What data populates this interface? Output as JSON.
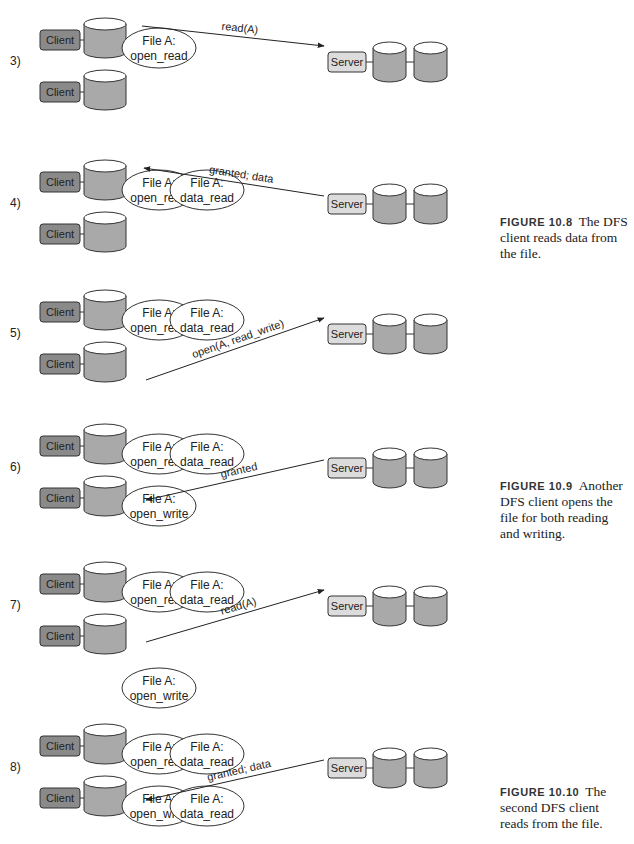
{
  "colors": {
    "client_fill": "#8a8a8a",
    "server_fill": "#dcdcdc",
    "cylinder_body": "#a9a9a9",
    "cylinder_top": "#ffffff",
    "stroke": "#333333"
  },
  "panels": [
    {
      "step": "3)",
      "y": 16,
      "client_label": "Client",
      "server_label": "Server",
      "bubbles_top": [
        {
          "line1": "File A:",
          "line2": "open_read"
        }
      ],
      "bubbles_bottom": [],
      "message": {
        "text": "read(A)",
        "direction": "to-server",
        "from": "client1"
      }
    },
    {
      "step": "4)",
      "y": 158,
      "client_label": "Client",
      "server_label": "Server",
      "bubbles_top": [
        {
          "line1": "File A:",
          "line2": "open_read"
        },
        {
          "line1": "File A:",
          "line2": "data_read"
        }
      ],
      "bubbles_bottom": [],
      "message": {
        "text": "granted; data",
        "direction": "to-client",
        "from": "server"
      }
    },
    {
      "step": "5)",
      "y": 288,
      "client_label": "Client",
      "server_label": "Server",
      "bubbles_top": [
        {
          "line1": "File A:",
          "line2": "open_read"
        },
        {
          "line1": "File A:",
          "line2": "data_read"
        }
      ],
      "bubbles_bottom": [],
      "message": {
        "text": "open(A, read_write)",
        "direction": "to-server",
        "from": "client2"
      }
    },
    {
      "step": "6)",
      "y": 422,
      "client_label": "Client",
      "server_label": "Server",
      "bubbles_top": [
        {
          "line1": "File A:",
          "line2": "open_read"
        },
        {
          "line1": "File A:",
          "line2": "data_read"
        }
      ],
      "bubbles_bottom": [
        {
          "line1": "File A:",
          "line2": "open_write"
        }
      ],
      "message": {
        "text": "granted",
        "direction": "to-client",
        "from": "server"
      }
    },
    {
      "step": "7)",
      "y": 560,
      "client_label": "Client",
      "server_label": "Server",
      "bubbles_top": [
        {
          "line1": "File A:",
          "line2": "open_read"
        },
        {
          "line1": "File A:",
          "line2": "data_read"
        }
      ],
      "bubbles_bottom": [
        {
          "line1": "File A:",
          "line2": "open_write"
        }
      ],
      "message": {
        "text": "read(A)",
        "direction": "to-server",
        "from": "client2"
      }
    },
    {
      "step": "8)",
      "y": 722,
      "client_label": "Client",
      "server_label": "Server",
      "bubbles_top": [
        {
          "line1": "File A:",
          "line2": "open_read"
        },
        {
          "line1": "File A:",
          "line2": "data_read"
        }
      ],
      "bubbles_bottom": [
        {
          "line1": "File A:",
          "line2": "open_write"
        },
        {
          "line1": "File A:",
          "line2": "data_read"
        }
      ],
      "message": {
        "text": "granted; data",
        "direction": "to-client",
        "from": "server"
      }
    }
  ],
  "captions": [
    {
      "figure": "FIGURE 10.8",
      "text": "The DFS client reads data from the file.",
      "y": 214
    },
    {
      "figure": "FIGURE 10.9",
      "text": "Another DFS client opens the file for both reading and writing.",
      "y": 478
    },
    {
      "figure": "FIGURE 10.10",
      "text": "The second DFS client reads from the file.",
      "y": 784
    }
  ]
}
